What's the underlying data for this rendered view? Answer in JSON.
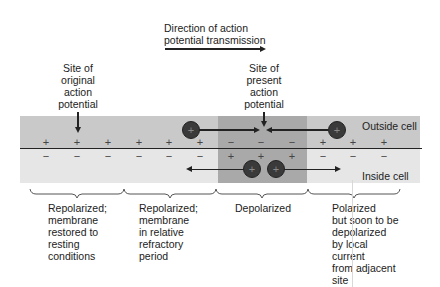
{
  "title": {
    "line1": "Direction of action",
    "line2": "potential transmission"
  },
  "labels": {
    "original_site": [
      "Site of",
      "original",
      "action",
      "potential"
    ],
    "present_site": [
      "Site of",
      "present",
      "action",
      "potential"
    ],
    "outside": "Outside cell",
    "inside": "Inside cell"
  },
  "charges": {
    "outside_top": [
      "+",
      "+",
      "+",
      "+",
      "+",
      "+",
      "−",
      "−",
      "−",
      "+",
      "+",
      "+"
    ],
    "inside_bottom": [
      "−",
      "−",
      "−",
      "−",
      "−",
      "−",
      "+",
      "+",
      "+",
      "−",
      "−",
      "−"
    ]
  },
  "ion_symbol": "+",
  "regions": [
    {
      "name": "repolarized-resting",
      "lines": [
        "Repolarized;",
        "membrane",
        "restored to",
        "resting",
        "conditions"
      ]
    },
    {
      "name": "repolarized-refractory",
      "lines": [
        "Repolarized;",
        "membrane",
        "in relative",
        "refractory",
        "period"
      ]
    },
    {
      "name": "depolarized",
      "lines": [
        "Depolarized"
      ]
    },
    {
      "name": "polarized-soon",
      "lines": [
        "Polarized",
        "but soon to be",
        "depolarized",
        "by local",
        "current",
        "from adjacent",
        "site"
      ]
    }
  ],
  "colors": {
    "outside_band": "#c9c9c9",
    "inside_band": "#e4e4e4",
    "depolarized_band": "#a9a9a9"
  }
}
